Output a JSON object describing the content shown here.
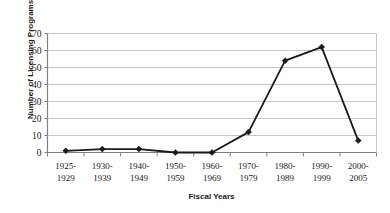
{
  "chart_data": {
    "type": "line",
    "title": "",
    "xlabel": "Fiscal Years",
    "ylabel": "Number of Licensing Programs Started",
    "categories": [
      "1925-1929",
      "1930-1939",
      "1940-1949",
      "1950-1959",
      "1960-1969",
      "1970-1979",
      "1980-1989",
      "1990-1999",
      "2000-2005"
    ],
    "values": [
      1,
      2,
      2,
      0,
      0,
      12,
      54,
      62,
      7
    ],
    "ylim": [
      0,
      70
    ],
    "ytick_values": [
      0,
      10,
      20,
      30,
      40,
      50,
      60,
      70
    ],
    "ytick_labels": [
      "0",
      "10",
      "20",
      "30",
      "40",
      "50",
      "60",
      "70"
    ],
    "grid": "horizontal",
    "legend": "none",
    "series_color": "#1a1a1a",
    "gridline_color": "#c8c8c8",
    "axis_color": "#808080",
    "marker": "diamond"
  }
}
